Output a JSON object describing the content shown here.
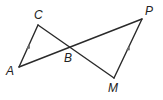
{
  "diagram": {
    "type": "geometry",
    "points": {
      "A": {
        "label": "A",
        "x": 19,
        "y": 67
      },
      "C": {
        "label": "C",
        "x": 38,
        "y": 25
      },
      "B": {
        "label": "B",
        "x": 68,
        "y": 48
      },
      "P": {
        "label": "P",
        "x": 142,
        "y": 19
      },
      "M": {
        "label": "M",
        "x": 114,
        "y": 78
      }
    },
    "segments": [
      {
        "from": "A",
        "to": "C",
        "marked_parallel": true
      },
      {
        "from": "A",
        "to": "P",
        "marked_parallel": false
      },
      {
        "from": "C",
        "to": "M",
        "marked_parallel": false
      },
      {
        "from": "M",
        "to": "P",
        "marked_parallel": true
      }
    ],
    "labels": {
      "A": "A",
      "B": "B",
      "C": "C",
      "M": "M",
      "P": "P"
    },
    "colors": {
      "line": "#2a2a2a",
      "arrow": "#6a6a6a",
      "background": "#ffffff"
    }
  }
}
